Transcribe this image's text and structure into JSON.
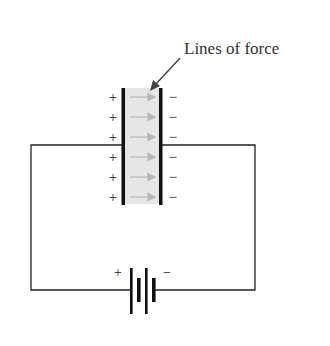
{
  "diagram": {
    "annotation": "Lines of force",
    "capacitor": {
      "left_plate_charges": [
        "+",
        "+",
        "+",
        "+",
        "+",
        "+"
      ],
      "right_plate_charges": [
        "−",
        "−",
        "−",
        "−",
        "−",
        "−"
      ],
      "field_arrow_count": 6
    },
    "battery": {
      "positive_label": "+",
      "negative_label": "−"
    },
    "colors": {
      "wire": "#222222",
      "plate": "#111111",
      "dielectric_fill": "#e6e6e6",
      "field_arrow": "#b8b8b8",
      "label_text": "#333333"
    }
  }
}
